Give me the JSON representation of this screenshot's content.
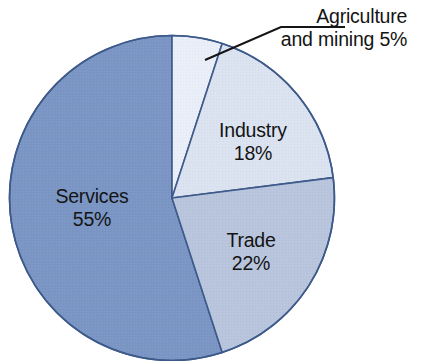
{
  "chart_data": {
    "type": "pie",
    "title": "",
    "subtitle": "",
    "xlabel": "",
    "ylabel": "",
    "legend_position": "none",
    "grid": false,
    "start_angle_deg": 0,
    "direction": "clockwise",
    "categories": [
      "Agriculture and mining",
      "Industry",
      "Trade",
      "Services"
    ],
    "values": [
      5,
      18,
      22,
      55
    ],
    "unit": "%",
    "slices": [
      {
        "label": "Agriculture and mining",
        "value": 5,
        "value_text": "5%",
        "color": "#e9eef8",
        "label_placement": "outside",
        "has_leader_line": true
      },
      {
        "label": "Industry",
        "value": 18,
        "value_text": "18%",
        "color": "#dbe3f1",
        "label_placement": "inside",
        "has_leader_line": false
      },
      {
        "label": "Trade",
        "value": 22,
        "value_text": "22%",
        "color": "#b8c5dd",
        "label_placement": "inside",
        "has_leader_line": false
      },
      {
        "label": "Services",
        "value": 55,
        "value_text": "55%",
        "color": "#7b96c4",
        "label_placement": "inside",
        "has_leader_line": false
      }
    ]
  },
  "labels": {
    "services": {
      "name": "Services",
      "value": "55%"
    },
    "industry": {
      "name": "Industry",
      "value": "18%"
    },
    "trade": {
      "name": "Trade",
      "value": "22%"
    },
    "agriculture": {
      "line1": "Agriculture",
      "line2": "and mining 5%"
    }
  },
  "colors": {
    "agriculture": "#e9eef8",
    "industry": "#dbe3f1",
    "trade": "#b8c5dd",
    "services": "#7b96c4",
    "slice_border": "#3d5a8a",
    "leader_line": "#151515",
    "text": "#141414",
    "background": "#ffffff"
  }
}
